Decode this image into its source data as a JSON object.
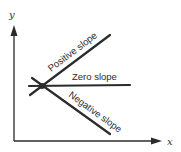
{
  "diagram": {
    "axes": {
      "x_label": "x",
      "y_label": "y"
    },
    "lines": [
      {
        "name": "positive",
        "label": "Positive slope"
      },
      {
        "name": "zero",
        "label": "Zero slope"
      },
      {
        "name": "negative",
        "label": "Negative slope"
      }
    ],
    "colors": {
      "ink": "#2b2b2b",
      "background": "#ffffff"
    }
  }
}
